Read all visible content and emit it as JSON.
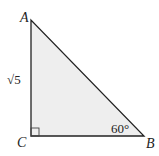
{
  "figure": {
    "type": "right-triangle",
    "fill_color": "#eeeeee",
    "stroke_color": "#222222",
    "vertices": {
      "A": {
        "label": "A"
      },
      "B": {
        "label": "B"
      },
      "C": {
        "label": "C"
      }
    },
    "side_labels": {
      "AC": "√5"
    },
    "angle_labels": {
      "B": "60°"
    },
    "right_angle_at": "C"
  }
}
